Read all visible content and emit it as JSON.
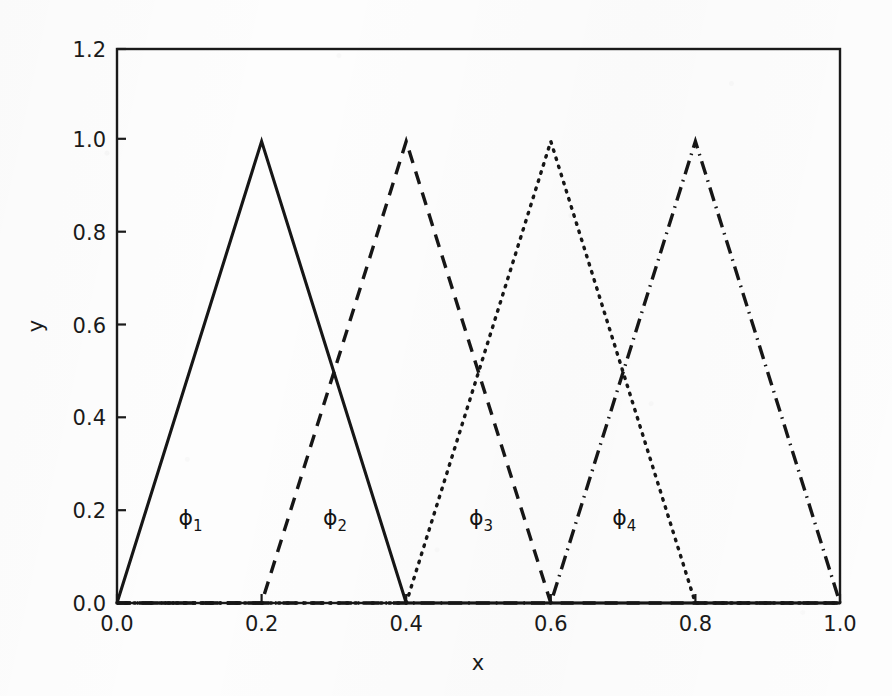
{
  "chart_data": {
    "type": "line",
    "title": "",
    "subtitle": "",
    "xlabel": "x",
    "ylabel": "y",
    "xlim": [
      0.0,
      1.0
    ],
    "ylim": [
      0.0,
      1.2
    ],
    "xticks": [
      "0.0",
      "0.2",
      "0.4",
      "0.6",
      "0.8",
      "1.0"
    ],
    "xtick_values": [
      0.0,
      0.2,
      0.4,
      0.6,
      0.8,
      1.0
    ],
    "yticks": [
      "0.0",
      "0.2",
      "0.4",
      "0.6",
      "0.8",
      "1.0",
      "1.2"
    ],
    "ytick_values": [
      0.0,
      0.2,
      0.4,
      0.6,
      0.8,
      1.0,
      1.2
    ],
    "grid": false,
    "legend": "none",
    "line_color": "#161616",
    "series": [
      {
        "name": "phi-1",
        "label": "ϕ",
        "subscript": "1",
        "linestyle": "solid",
        "peak_x": 0.2,
        "peak_y": 1.0,
        "x": [
          0.0,
          0.2,
          0.4,
          1.0
        ],
        "values": [
          0.0,
          1.0,
          0.0,
          0.0
        ],
        "annotation_x": 0.085,
        "annotation_y": 0.185
      },
      {
        "name": "phi-2",
        "label": "ϕ",
        "subscript": "2",
        "linestyle": "dashed",
        "peak_x": 0.4,
        "peak_y": 1.0,
        "x": [
          0.0,
          0.2,
          0.4,
          0.6,
          1.0
        ],
        "values": [
          0.0,
          0.0,
          1.0,
          0.0,
          0.0
        ],
        "annotation_x": 0.285,
        "annotation_y": 0.185
      },
      {
        "name": "phi-3",
        "label": "ϕ",
        "subscript": "3",
        "linestyle": "dotted",
        "peak_x": 0.6,
        "peak_y": 1.0,
        "x": [
          0.0,
          0.4,
          0.6,
          0.8,
          1.0
        ],
        "values": [
          0.0,
          0.0,
          1.0,
          0.0,
          0.0
        ],
        "annotation_x": 0.487,
        "annotation_y": 0.185
      },
      {
        "name": "phi-4",
        "label": "ϕ",
        "subscript": "4",
        "linestyle": "dashdot",
        "peak_x": 0.8,
        "peak_y": 1.0,
        "x": [
          0.0,
          0.6,
          0.8,
          1.0
        ],
        "values": [
          0.0,
          0.0,
          1.0,
          0.0
        ],
        "annotation_x": 0.685,
        "annotation_y": 0.185
      }
    ]
  },
  "axes": {
    "x_axis_label": "x",
    "y_axis_label": "y"
  },
  "xticks": {
    "t0": "0.0",
    "t1": "0.2",
    "t2": "0.4",
    "t3": "0.6",
    "t4": "0.8",
    "t5": "1.0"
  },
  "yticks": {
    "t0": "0.0",
    "t1": "0.2",
    "t2": "0.4",
    "t3": "0.6",
    "t4": "0.8",
    "t5": "1.0",
    "t6": "1.2"
  },
  "annotations": {
    "phi1_symbol": "ϕ",
    "phi1_sub": "1",
    "phi2_symbol": "ϕ",
    "phi2_sub": "2",
    "phi3_symbol": "ϕ",
    "phi3_sub": "3",
    "phi4_symbol": "ϕ",
    "phi4_sub": "4"
  }
}
